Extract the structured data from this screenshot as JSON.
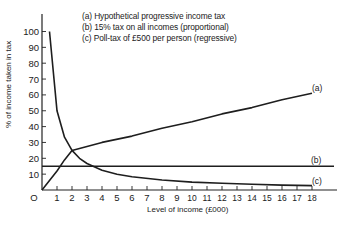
{
  "chart_data": {
    "type": "line",
    "title": "",
    "xlabel": "Level of income (£000)",
    "ylabel": "% of income taken in tax",
    "xlim": [
      0,
      18
    ],
    "ylim": [
      0,
      100
    ],
    "xticks": [
      0,
      1,
      2,
      3,
      4,
      5,
      6,
      7,
      8,
      9,
      10,
      11,
      12,
      13,
      14,
      15,
      16,
      17,
      18
    ],
    "yticks": [
      10,
      20,
      30,
      40,
      50,
      60,
      70,
      80,
      90,
      100
    ],
    "grid": false,
    "legend": [
      "(a) Hypothetical progressive income tax",
      "(b) 15% tax on all incomes (proportional)",
      "(c) Poll-tax of £500 per person (regressive)"
    ],
    "legend_position": "top",
    "series": [
      {
        "name": "(a)",
        "label": "(a)",
        "description": "Hypothetical progressive income tax",
        "x": [
          0,
          0.5,
          1,
          1.5,
          2,
          4,
          6,
          8,
          10,
          12,
          14,
          16,
          18
        ],
        "y": [
          0,
          6,
          12,
          19,
          25,
          30,
          34,
          39,
          43,
          48,
          52,
          57,
          61
        ]
      },
      {
        "name": "(b)",
        "label": "(b)",
        "description": "15% tax on all incomes (proportional)",
        "x": [
          0,
          19.5
        ],
        "y": [
          15,
          15
        ]
      },
      {
        "name": "(c)",
        "label": "(c)",
        "description": "Poll-tax of £500 per person (regressive)",
        "x": [
          0.5,
          1,
          1.5,
          2,
          2.5,
          3,
          4,
          5,
          6,
          8,
          10,
          12,
          14,
          16,
          18
        ],
        "y": [
          100,
          50,
          33.3,
          25,
          20,
          16.7,
          12.5,
          10,
          8.3,
          6.3,
          5,
          4.2,
          3.6,
          3.1,
          2.8
        ]
      }
    ]
  },
  "labels": {
    "legend_a": "(a) Hypothetical progressive income tax",
    "legend_b": "(b) 15% tax on all incomes (proportional)",
    "legend_c": "(c) Poll-tax of £500 per person (regressive)",
    "xlabel": "Level of income (£000)",
    "ylabel": "% of income taken in tax",
    "series_a": "(a)",
    "series_b": "(b)",
    "series_c": "(c)",
    "origin": "O"
  }
}
